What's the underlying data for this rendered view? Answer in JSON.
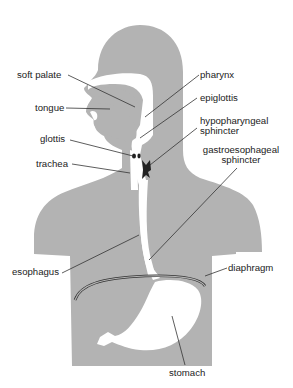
{
  "diagram": {
    "colors": {
      "body": "#b3b3b3",
      "passage": "#ffffff",
      "sphincter": "#222222",
      "leader": "#333333",
      "text": "#222222"
    },
    "labels": {
      "soft_palate": "soft palate",
      "tongue": "tongue",
      "glottis": "glottis",
      "trachea": "trachea",
      "esophagus": "esophagus",
      "pharynx": "pharynx",
      "epiglottis": "epiglottis",
      "hypopharyngeal_line1": "hypopharyngeal",
      "hypopharyngeal_line2": "sphincter",
      "gastroesophageal_line1": "gastroesophageal",
      "gastroesophageal_line2": "sphincter",
      "diaphragm": "diaphragm",
      "stomach": "stomach"
    }
  }
}
